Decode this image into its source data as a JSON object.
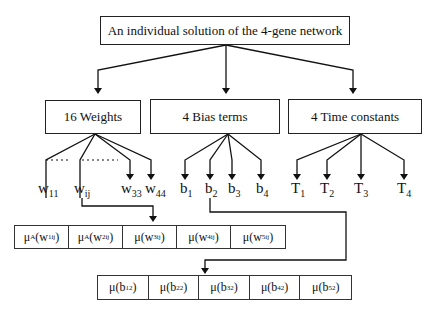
{
  "root": {
    "label": "An individual solution of the 4-gene network"
  },
  "categories": [
    {
      "label": "16 Weights"
    },
    {
      "label": "4 Bias terms"
    },
    {
      "label": "4 Time constants"
    }
  ],
  "weights": [
    {
      "base": "w",
      "sub": "11"
    },
    {
      "base": "w",
      "sub": "ij"
    },
    {
      "base": "w",
      "sub": "33"
    },
    {
      "base": "w",
      "sub": "44"
    }
  ],
  "biases": [
    {
      "base": "b",
      "sub": "1"
    },
    {
      "base": "b",
      "sub": "2"
    },
    {
      "base": "b",
      "sub": "3"
    },
    {
      "base": "b",
      "sub": "4"
    }
  ],
  "time_constants": [
    {
      "base": "T",
      "sub": "1"
    },
    {
      "base": "T",
      "sub": "2"
    },
    {
      "base": "T",
      "sub": "3"
    },
    {
      "base": "T",
      "sub": "4"
    }
  ],
  "weight_membership": [
    {
      "fn": "μ",
      "fn_sub": "A",
      "var": "w",
      "sup": "1",
      "sub": "ij"
    },
    {
      "fn": "μ",
      "fn_sub": "A",
      "var": "w",
      "sup": "2",
      "sub": "ij"
    },
    {
      "fn": "μ",
      "fn_sub": "",
      "var": "w",
      "sup": "3",
      "sub": "ij"
    },
    {
      "fn": "μ",
      "fn_sub": "",
      "var": "w",
      "sup": "4",
      "sub": "ij"
    },
    {
      "fn": "μ",
      "fn_sub": "",
      "var": "w",
      "sup": "5",
      "sub": "ij"
    }
  ],
  "bias_membership": [
    {
      "fn": "μ",
      "fn_sub": "",
      "var": "b",
      "sup": "1",
      "sub": "2"
    },
    {
      "fn": "μ",
      "fn_sub": "",
      "var": "b",
      "sup": "2",
      "sub": "2"
    },
    {
      "fn": "μ",
      "fn_sub": "",
      "var": "b",
      "sup": "3",
      "sub": "2"
    },
    {
      "fn": "μ",
      "fn_sub": "",
      "var": "b",
      "sup": "4",
      "sub": "2"
    },
    {
      "fn": "μ",
      "fn_sub": "",
      "var": "b",
      "sup": "5",
      "sub": "2"
    }
  ]
}
